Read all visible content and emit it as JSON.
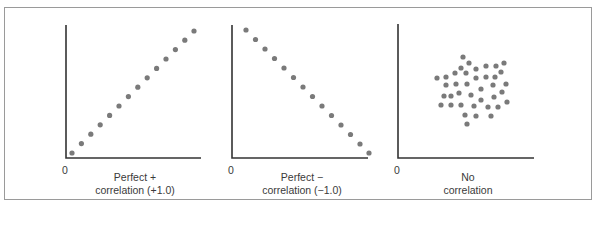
{
  "style": {
    "dot_color": "#7a7a7a",
    "axis_color": "#333333",
    "border_color": "#9a9a9a",
    "text_color": "#3a3a3a"
  },
  "chart_data": [
    {
      "type": "scatter",
      "title": "Perfect + correlation (+1.0)",
      "label_lines": [
        "Perfect +",
        "correlation (+1.0)"
      ],
      "origin_label": "0",
      "xlabel": "",
      "ylabel": "",
      "grid": false,
      "axis": {
        "origin": [
          66,
          158
        ],
        "x_end": 201,
        "y_top": 25
      },
      "points": [
        [
          72,
          153
        ],
        [
          81.4,
          143.6
        ],
        [
          90.8,
          134.2
        ],
        [
          100.2,
          124.8
        ],
        [
          109.6,
          115.4
        ],
        [
          119,
          106
        ],
        [
          128.4,
          96.6
        ],
        [
          137.8,
          87.2
        ],
        [
          147.2,
          77.8
        ],
        [
          156.6,
          68.4
        ],
        [
          166,
          59
        ],
        [
          175.4,
          49.6
        ],
        [
          184.8,
          40.2
        ],
        [
          194,
          31
        ]
      ],
      "label_pos": [
        60,
        171
      ],
      "origin_pos": [
        62,
        164
      ]
    },
    {
      "type": "scatter",
      "title": "Perfect − correlation (−1.0)",
      "label_lines": [
        "Perfect −",
        "correlation (−1.0)"
      ],
      "origin_label": "0",
      "xlabel": "",
      "ylabel": "",
      "grid": false,
      "axis": {
        "origin": [
          232,
          158
        ],
        "x_end": 368,
        "y_top": 25
      },
      "points": [
        [
          246,
          30
        ],
        [
          255.5,
          39.5
        ],
        [
          265,
          49
        ],
        [
          274.5,
          58.5
        ],
        [
          284,
          68
        ],
        [
          293.5,
          77.5
        ],
        [
          303,
          87
        ],
        [
          312.5,
          96.5
        ],
        [
          322,
          106
        ],
        [
          331.5,
          115.5
        ],
        [
          341,
          125
        ],
        [
          350.5,
          134.5
        ],
        [
          360,
          144
        ],
        [
          369,
          153
        ]
      ],
      "label_pos": [
        227,
        171
      ],
      "origin_pos": [
        228,
        164
      ]
    },
    {
      "type": "scatter",
      "title": "No correlation",
      "label_lines": [
        "No",
        "correlation"
      ],
      "origin_label": "0",
      "xlabel": "",
      "ylabel": "",
      "grid": false,
      "axis": {
        "origin": [
          398,
          158
        ],
        "x_end": 534,
        "y_top": 24
      },
      "points": [
        [
          463,
          57
        ],
        [
          469,
          63
        ],
        [
          461,
          68
        ],
        [
          476,
          69
        ],
        [
          486,
          66
        ],
        [
          496,
          66
        ],
        [
          504,
          63
        ],
        [
          455,
          73
        ],
        [
          466,
          73
        ],
        [
          501,
          72
        ],
        [
          437,
          78
        ],
        [
          446,
          77
        ],
        [
          476,
          78
        ],
        [
          486,
          77
        ],
        [
          495,
          77
        ],
        [
          446,
          85
        ],
        [
          456,
          84
        ],
        [
          467,
          84
        ],
        [
          493,
          85
        ],
        [
          506,
          84
        ],
        [
          481,
          89
        ],
        [
          459,
          93
        ],
        [
          502,
          92
        ],
        [
          444,
          96
        ],
        [
          451,
          96
        ],
        [
          471,
          95
        ],
        [
          481,
          100
        ],
        [
          494,
          97
        ],
        [
          441,
          105
        ],
        [
          451,
          105
        ],
        [
          461,
          105
        ],
        [
          474,
          106
        ],
        [
          488,
          107
        ],
        [
          498,
          107
        ],
        [
          507,
          102
        ],
        [
          465,
          115
        ],
        [
          476,
          116
        ],
        [
          491,
          116
        ],
        [
          467,
          124
        ]
      ],
      "label_pos": [
        393,
        171
      ],
      "origin_pos": [
        394,
        164
      ]
    }
  ]
}
